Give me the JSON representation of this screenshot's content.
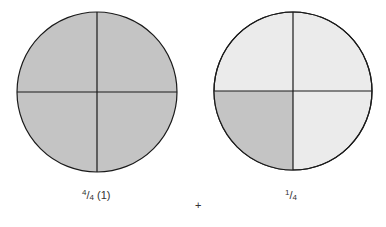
{
  "diagram": {
    "left_circle": {
      "parts": 4,
      "shaded_parts": 4,
      "label_numerator": "4",
      "label_denominator": "4",
      "label_suffix": "(1)"
    },
    "operator": "+",
    "right_circle": {
      "parts": 4,
      "shaded_parts": 1,
      "shaded_quadrant": "bottom-left",
      "label_numerator": "1",
      "label_denominator": "4"
    },
    "colors": {
      "shaded": "#c4c4c4",
      "unshaded": "#ebebeb",
      "outline": "#1a1a1a",
      "background": "#ffffff"
    }
  }
}
